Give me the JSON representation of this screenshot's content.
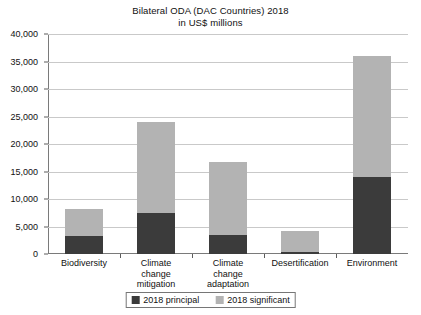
{
  "chart_data": {
    "type": "bar",
    "title": "Bilateral ODA (DAC Countries) 2018",
    "subtitle": "in US$ millions",
    "xlabel": "",
    "ylabel": "",
    "ylim": [
      0,
      40000
    ],
    "ytick_step": 5000,
    "grid": true,
    "stacked": true,
    "legend_position": "bottom",
    "categories": [
      "Biodiversity",
      "Climate change mitigation",
      "Climate change adaptation",
      "Desertification",
      "Environment"
    ],
    "category_lines": [
      [
        "Biodiversity"
      ],
      [
        "Climate",
        "change",
        "mitigation"
      ],
      [
        "Climate",
        "change",
        "adaptation"
      ],
      [
        "Desertification"
      ],
      [
        "Environment"
      ]
    ],
    "ytick_labels": [
      "0",
      "5,000",
      "10,000",
      "15,000",
      "20,000",
      "25,000",
      "30,000",
      "35,000",
      "40,000"
    ],
    "ytick_values": [
      0,
      5000,
      10000,
      15000,
      20000,
      25000,
      30000,
      35000,
      40000
    ],
    "series": [
      {
        "name": "2018 principal",
        "color": "#3b3b3b",
        "values": [
          3200,
          7500,
          3500,
          400,
          14000
        ]
      },
      {
        "name": "2018 significant",
        "color": "#b3b3b3",
        "values": [
          5000,
          16500,
          13300,
          3800,
          22000
        ]
      }
    ],
    "totals": [
      8200,
      24000,
      16800,
      4200,
      36000
    ]
  },
  "legend": {
    "items": [
      {
        "label": "2018 principal",
        "swatch": "dark-square-swatch"
      },
      {
        "label": "2018 significant",
        "swatch": "light-square-swatch"
      }
    ]
  },
  "colors": {
    "principal": "#3b3b3b",
    "significant": "#b3b3b3",
    "gridline": "#c9c9c9",
    "axis": "#7a7a7a",
    "text": "#111111",
    "background": "#ffffff"
  }
}
